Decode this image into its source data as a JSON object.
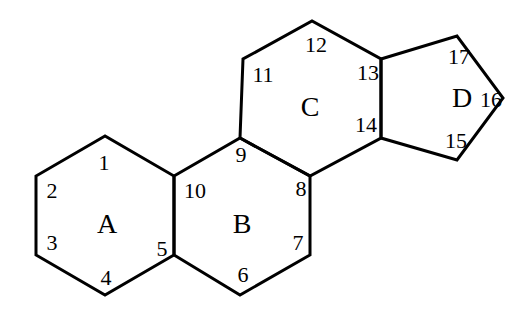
{
  "rings": [
    {
      "label": "A",
      "x": 107,
      "y": 233
    },
    {
      "label": "B",
      "x": 242,
      "y": 233
    },
    {
      "label": "C",
      "x": 310,
      "y": 116
    },
    {
      "label": "D",
      "x": 462,
      "y": 107
    }
  ],
  "atoms": [
    {
      "label": "1",
      "x": 104,
      "y": 170
    },
    {
      "label": "2",
      "x": 52,
      "y": 198
    },
    {
      "label": "3",
      "x": 52,
      "y": 250
    },
    {
      "label": "4",
      "x": 106,
      "y": 285
    },
    {
      "label": "5",
      "x": 162,
      "y": 256
    },
    {
      "label": "6",
      "x": 243,
      "y": 282
    },
    {
      "label": "7",
      "x": 298,
      "y": 250
    },
    {
      "label": "8",
      "x": 301,
      "y": 196
    },
    {
      "label": "9",
      "x": 241,
      "y": 162
    },
    {
      "label": "10",
      "x": 195,
      "y": 198
    },
    {
      "label": "11",
      "x": 263,
      "y": 82
    },
    {
      "label": "12",
      "x": 316,
      "y": 52
    },
    {
      "label": "13",
      "x": 368,
      "y": 80
    },
    {
      "label": "14",
      "x": 366,
      "y": 132
    },
    {
      "label": "15",
      "x": 456,
      "y": 148
    },
    {
      "label": "16",
      "x": 491,
      "y": 107
    },
    {
      "label": "17",
      "x": 459,
      "y": 64
    }
  ],
  "colors": {
    "stroke": "#000000",
    "background": "#ffffff"
  }
}
